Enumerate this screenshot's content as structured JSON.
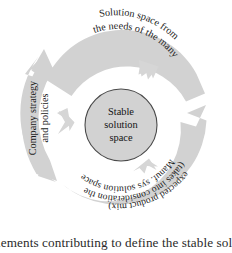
{
  "figure": {
    "type": "cycle-diagram",
    "title_visible": false,
    "center": {
      "label_lines": [
        "Stable",
        "solution",
        "space"
      ],
      "fill_color": "#d2d2d2",
      "border_color": "#4a4a4a"
    },
    "ring": {
      "fill_color": "#d2d2d2",
      "segment_count": 3,
      "flow_direction": "clockwise",
      "segments": [
        {
          "id": "needs-of-many",
          "position": "top",
          "label_lines": [
            "Solution space from",
            "the needs of the many"
          ],
          "full_label": "Solution space from the needs of the many"
        },
        {
          "id": "manuf-sys-solution-space",
          "position": "bottom-right",
          "label_lines": [
            "Manuf. sys solution space",
            "(takes into consideration the",
            "expected product mix)"
          ],
          "full_label": "Manuf. sys solution space (takes into consideration the expected product mix)"
        },
        {
          "id": "company-strategy",
          "position": "left",
          "label_lines": [
            "Company strategy",
            "and policies"
          ],
          "full_label": "Company strategy and policies"
        }
      ]
    },
    "arrows": {
      "count": 3,
      "direction": "inward",
      "fill_color": "#d6d6d6"
    }
  },
  "caption": {
    "text": "elements contributing to define the stable solution",
    "cropped": true
  }
}
